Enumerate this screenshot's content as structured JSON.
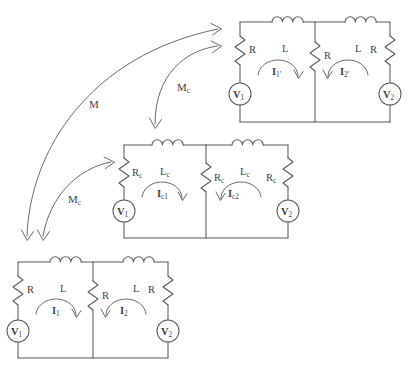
{
  "figure": {
    "background_color": "#ffffff",
    "line_color": "#5a5a5a",
    "text_color": "#3f3f3f"
  },
  "circuits": [
    {
      "id": "top-right",
      "name": "primed-circuit",
      "inductors": [
        {
          "label": "L",
          "sub": ""
        },
        {
          "label": "L",
          "sub": ""
        }
      ],
      "resistors": [
        {
          "label": "R",
          "sub": ""
        },
        {
          "label": "R",
          "sub": ""
        },
        {
          "label": "R",
          "sub": ""
        }
      ],
      "currents": [
        {
          "label": "I",
          "sub": "1'"
        },
        {
          "label": "I",
          "sub": "2'"
        }
      ],
      "sources": [
        {
          "label": "V",
          "sub": "1"
        },
        {
          "label": "V",
          "sub": "2"
        }
      ]
    },
    {
      "id": "middle",
      "name": "c-subscript-circuit",
      "inductors": [
        {
          "label": "L",
          "sub": "c"
        },
        {
          "label": "L",
          "sub": "c"
        }
      ],
      "resistors": [
        {
          "label": "R",
          "sub": "c"
        },
        {
          "label": "R",
          "sub": "c"
        },
        {
          "label": "R",
          "sub": "c"
        }
      ],
      "currents": [
        {
          "label": "I",
          "sub": "c1"
        },
        {
          "label": "I",
          "sub": "c2"
        }
      ],
      "sources": [
        {
          "label": "V",
          "sub": "1"
        },
        {
          "label": "V",
          "sub": "2"
        }
      ]
    },
    {
      "id": "bottom-left",
      "name": "base-circuit",
      "inductors": [
        {
          "label": "L",
          "sub": ""
        },
        {
          "label": "L",
          "sub": ""
        }
      ],
      "resistors": [
        {
          "label": "R",
          "sub": ""
        },
        {
          "label": "R",
          "sub": ""
        },
        {
          "label": "R",
          "sub": ""
        }
      ],
      "currents": [
        {
          "label": "I",
          "sub": "1"
        },
        {
          "label": "I",
          "sub": "2"
        }
      ],
      "sources": [
        {
          "label": "V",
          "sub": "1"
        },
        {
          "label": "V",
          "sub": "2"
        }
      ]
    }
  ],
  "coupling_arrows": [
    {
      "id": "m-main",
      "label": "M",
      "sub": "",
      "from": "bottom-left-circuit",
      "to": "top-right-circuit"
    },
    {
      "id": "mc-upper",
      "label": "M",
      "sub": "c",
      "from": "top-right-circuit",
      "to": "middle-circuit"
    },
    {
      "id": "mc-lower",
      "label": "M",
      "sub": "c",
      "from": "bottom-left-circuit",
      "to": "middle-circuit"
    }
  ]
}
